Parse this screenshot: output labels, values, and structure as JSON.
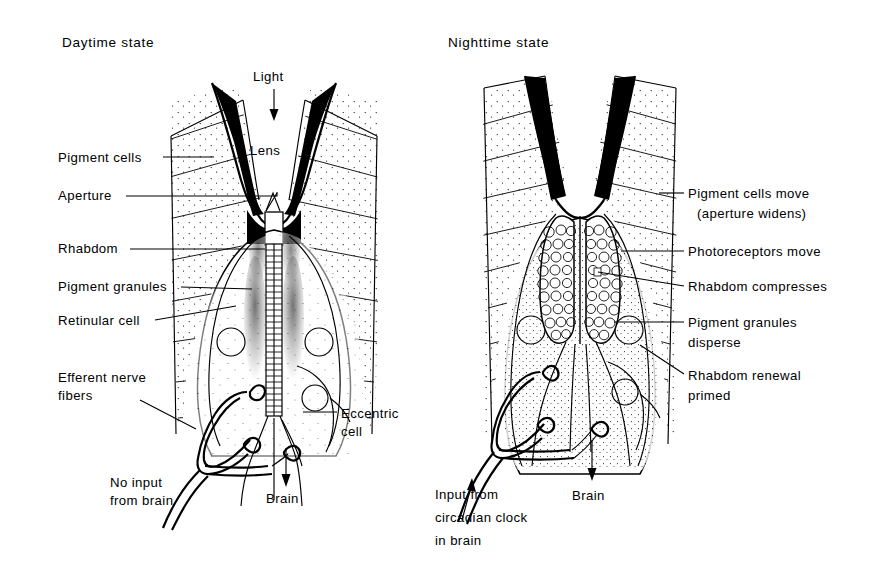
{
  "figure": {
    "background_color": "#ffffff",
    "ink_color": "#000000"
  },
  "panels": [
    {
      "id": "daytime",
      "title": "Daytime state",
      "top_label": "Light",
      "lens_label": "Lens",
      "output_label": "Brain",
      "left_labels": [
        {
          "id": "pigment-cells",
          "text": "Pigment cells"
        },
        {
          "id": "aperture",
          "text": "Aperture"
        },
        {
          "id": "rhabdom",
          "text": "Rhabdom"
        },
        {
          "id": "pigment-granules",
          "text": "Pigment granules"
        },
        {
          "id": "retinular-cell",
          "text": "Retinular cell"
        },
        {
          "id": "efferent-nerve-fibers",
          "text": "Efferent nerve",
          "text2": "fibers"
        }
      ],
      "right_labels": [
        {
          "id": "eccentric-cell",
          "text": "Eccentric",
          "text2": "cell"
        }
      ],
      "bottom_note": {
        "line1": "No input",
        "line2": "from brain"
      }
    },
    {
      "id": "nighttime",
      "title": "Nighttime state",
      "output_label": "Brain",
      "right_labels": [
        {
          "id": "pigment-cells-move",
          "text": "Pigment cells move",
          "text2": "(aperture widens)"
        },
        {
          "id": "photoreceptors-move",
          "text": "Photoreceptors move",
          "text2": ""
        },
        {
          "id": "rhabdom-compresses",
          "text": "Rhabdom compresses",
          "text2": ""
        },
        {
          "id": "pigment-granules-disperse",
          "text": "Pigment granules",
          "text2": "disperse"
        },
        {
          "id": "rhabdom-renewal-primed",
          "text": "Rhabdom renewal",
          "text2": "primed"
        }
      ],
      "bottom_note": {
        "line1": "Input from",
        "line2": "circadian clock",
        "line3": "in brain"
      }
    }
  ]
}
